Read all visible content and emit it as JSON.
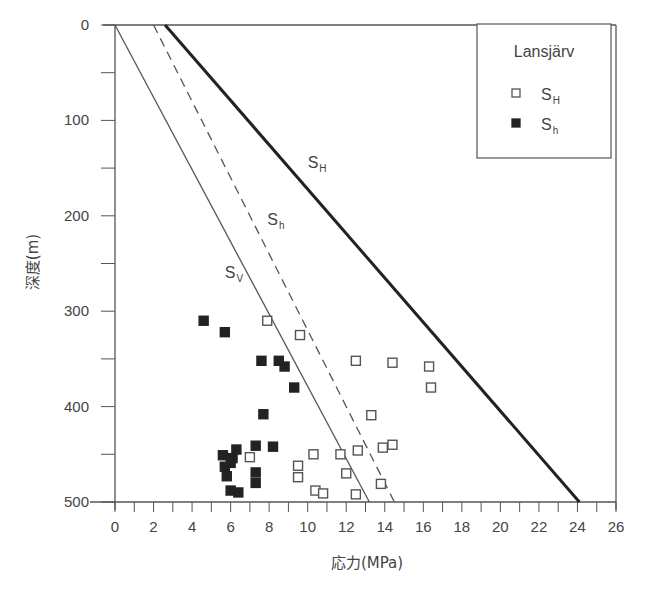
{
  "chart_data": {
    "type": "scatter",
    "title": "",
    "xlabel": "応力(MPa)",
    "ylabel": "深度(m)",
    "xlim": [
      0,
      26
    ],
    "ylim": [
      0,
      500
    ],
    "y_inverted": true,
    "x_ticks": [
      0,
      2,
      4,
      6,
      8,
      10,
      12,
      14,
      16,
      18,
      20,
      22,
      24,
      26
    ],
    "x_minor_step": 1,
    "y_ticks": [
      0,
      100,
      200,
      300,
      400,
      500
    ],
    "y_minor_step": 50,
    "grid": false,
    "legend": {
      "title": "Lansjärv",
      "position": "upper right",
      "entries": [
        {
          "marker": "open-square",
          "label": "S",
          "sub": "H"
        },
        {
          "marker": "filled-square",
          "label": "S",
          "sub": "h"
        }
      ]
    },
    "lines": [
      {
        "name": "SV",
        "label": "S",
        "sub": "V",
        "style": "solid-thin",
        "points": [
          [
            0,
            0
          ],
          [
            13.2,
            500
          ]
        ],
        "label_pos": [
          5.7,
          265
        ]
      },
      {
        "name": "Sh",
        "label": "S",
        "sub": "h",
        "style": "dashed",
        "points": [
          [
            2.0,
            0
          ],
          [
            14.5,
            500
          ]
        ],
        "label_pos": [
          7.9,
          210
        ]
      },
      {
        "name": "SH",
        "label": "S",
        "sub": "H",
        "style": "solid-thick",
        "points": [
          [
            2.6,
            0
          ],
          [
            24.1,
            500
          ]
        ],
        "label_pos": [
          10.0,
          150
        ]
      }
    ],
    "series": [
      {
        "name": "SH",
        "marker": "open-square",
        "points": [
          [
            7.9,
            310
          ],
          [
            9.6,
            325
          ],
          [
            12.5,
            352
          ],
          [
            14.4,
            354
          ],
          [
            16.3,
            358
          ],
          [
            16.4,
            380
          ],
          [
            13.3,
            409
          ],
          [
            14.4,
            440
          ],
          [
            13.9,
            443
          ],
          [
            12.6,
            446
          ],
          [
            11.7,
            450
          ],
          [
            10.3,
            450
          ],
          [
            7.0,
            453
          ],
          [
            9.5,
            462
          ],
          [
            9.5,
            474
          ],
          [
            12.0,
            470
          ],
          [
            13.8,
            481
          ],
          [
            10.4,
            488
          ],
          [
            10.8,
            491
          ],
          [
            12.5,
            492
          ]
        ]
      },
      {
        "name": "Sh",
        "marker": "filled-square",
        "points": [
          [
            4.6,
            310
          ],
          [
            5.7,
            322
          ],
          [
            7.6,
            352
          ],
          [
            8.5,
            352
          ],
          [
            8.8,
            358
          ],
          [
            9.3,
            380
          ],
          [
            7.7,
            408
          ],
          [
            6.3,
            445
          ],
          [
            7.3,
            441
          ],
          [
            8.2,
            442
          ],
          [
            5.6,
            451
          ],
          [
            6.1,
            454
          ],
          [
            6.0,
            459
          ],
          [
            5.7,
            463
          ],
          [
            5.8,
            473
          ],
          [
            7.3,
            469
          ],
          [
            7.3,
            480
          ],
          [
            6.0,
            488
          ],
          [
            6.4,
            490
          ]
        ]
      }
    ]
  }
}
